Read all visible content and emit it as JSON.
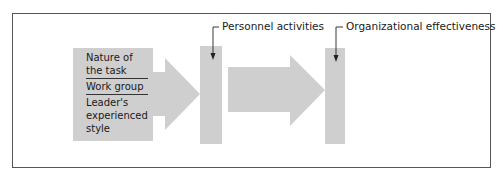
{
  "diagram": {
    "colors": {
      "shape_fill": "#cfcfcf",
      "frame_stroke": "#555555",
      "text": "#1a1a1a"
    },
    "input_box": {
      "items": [
        {
          "label": "Nature of the task"
        },
        {
          "label": "Work group"
        },
        {
          "label": "Leader's experienced style"
        }
      ]
    },
    "stages": [
      {
        "label": "Personnel activities"
      },
      {
        "label": "Organizational effectiveness"
      }
    ],
    "flow": [
      "input_box",
      "arrow",
      "Personnel activities",
      "arrow",
      "Organizational effectiveness"
    ]
  }
}
